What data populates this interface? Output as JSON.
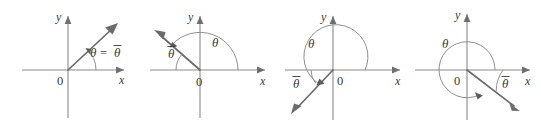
{
  "figure": {
    "background_color": "#ffffff",
    "axis_color": "#8a8a8a",
    "ray_color": "#6b6b6b",
    "arc_color": "#8f8f8f",
    "label_color": "#3a3a3a",
    "panel_count": 4
  },
  "symbols": {
    "theta": "θ",
    "theta_bar": "θ",
    "equals": "=",
    "origin": "0",
    "x_axis": "x",
    "y_axis": "y"
  },
  "panels": [
    {
      "id": "panel-1",
      "index": 1,
      "quadrant": "I",
      "x_label": "x",
      "y_label": "y",
      "origin_label": "0",
      "ray_angle_deg": 47,
      "theta_label": "θ",
      "theta_bar_label": "θ",
      "equation_label": "θ = θ",
      "arc_sweep_deg": 47,
      "caption": "theta equals theta-bar, ray in first quadrant"
    },
    {
      "id": "panel-2",
      "index": 2,
      "quadrant": "II",
      "x_label": "x",
      "y_label": "y",
      "origin_label": "0",
      "ray_angle_deg": 139,
      "theta_label": "θ",
      "theta_bar_label": "θ",
      "arc_sweep_deg": 139,
      "reference_arc_sweep_deg": 41,
      "caption": "ray in second quadrant, theta measured from positive x-axis, theta-bar from negative x-axis"
    },
    {
      "id": "panel-3",
      "index": 3,
      "quadrant": "III",
      "x_label": "x",
      "y_label": "y",
      "origin_label": "0",
      "ray_angle_deg": 215,
      "theta_label": "θ",
      "theta_bar_label": "θ",
      "arc_sweep_deg": 215,
      "reference_arc_sweep_deg": 35,
      "caption": "ray in third quadrant, theta measured counterclockwise, theta-bar is reference angle"
    },
    {
      "id": "panel-4",
      "index": 4,
      "quadrant": "IV",
      "x_label": "x",
      "y_label": "y",
      "origin_label": "0",
      "ray_angle_deg": 322,
      "theta_label": "θ",
      "theta_bar_label": "θ",
      "arc_sweep_deg": 322,
      "reference_arc_sweep_deg": 38,
      "caption": "ray in fourth quadrant, theta is a near-full rotation, theta-bar is reference angle"
    }
  ]
}
